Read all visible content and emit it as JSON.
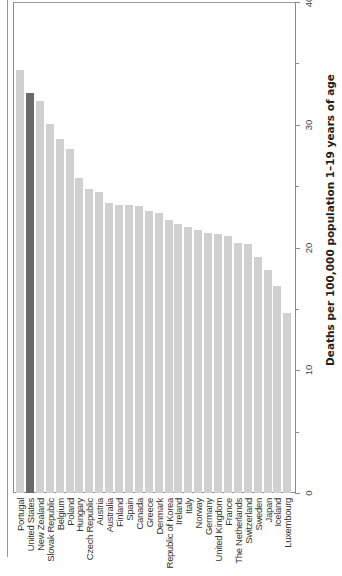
{
  "chart_data": {
    "type": "bar",
    "orientation": "rendered rotated 90° (bars vertical, text reads bottom-to-top)",
    "title": "",
    "xlabel": "",
    "ylabel": "Deaths per 100,000 population 1–19 years of age",
    "ylim": [
      0,
      40
    ],
    "yticks": [
      0,
      10,
      20,
      30,
      40
    ],
    "grid": false,
    "legend": null,
    "highlight": "United States",
    "colors": {
      "default": "#d0d0d0",
      "highlight": "#6a6a6a"
    },
    "categories": [
      "Portugal",
      "United States",
      "New Zealand",
      "Slovak Republic",
      "Belgium",
      "Poland",
      "Hungary",
      "Czech Republic",
      "Austria",
      "Australia",
      "Finland",
      "Spain",
      "Canada",
      "Greece",
      "Denmark",
      "Republic of Korea",
      "Ireland",
      "Italy",
      "Norway",
      "Germany",
      "United Kingdom",
      "France",
      "The Netherlands",
      "Switzerland",
      "Sweden",
      "Japan",
      "Iceland",
      "Luxembourg"
    ],
    "values": [
      34.5,
      32.6,
      31.9,
      30.1,
      28.8,
      28.0,
      25.7,
      24.8,
      24.5,
      23.6,
      23.5,
      23.5,
      23.4,
      23.0,
      22.8,
      22.2,
      21.9,
      21.7,
      21.4,
      21.2,
      21.1,
      20.9,
      20.4,
      20.3,
      19.2,
      18.2,
      16.9,
      14.7
    ]
  },
  "axis": {
    "title": "Deaths per 100,000 population 1–19 years of age",
    "tick_labels": [
      "0",
      "10",
      "20",
      "30",
      "40"
    ]
  }
}
